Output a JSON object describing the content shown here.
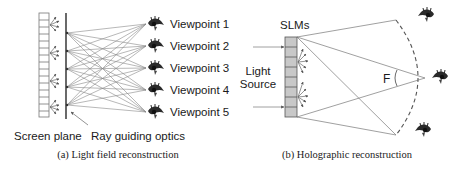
{
  "panel_a": {
    "viewpoints": [
      "Viewpoint 1",
      "Viewpoint 2",
      "Viewpoint 3",
      "Viewpoint 4",
      "Viewpoint 5"
    ],
    "screen_plane_label": "Screen plane",
    "optics_label": "Ray guiding optics",
    "caption": "(a) Light field reconstruction"
  },
  "panel_b": {
    "slm_label": "SLMs",
    "light_label_line1": "Light",
    "light_label_line2": "Source",
    "angle_label": "F",
    "caption": "(b) Holographic reconstruction"
  },
  "icons": {
    "eye": "eye-icon"
  },
  "colors": {
    "line": "#6e6e6e",
    "dark": "#333333",
    "slm_fill": "#c8c8c8",
    "text": "#1a1a1a"
  }
}
